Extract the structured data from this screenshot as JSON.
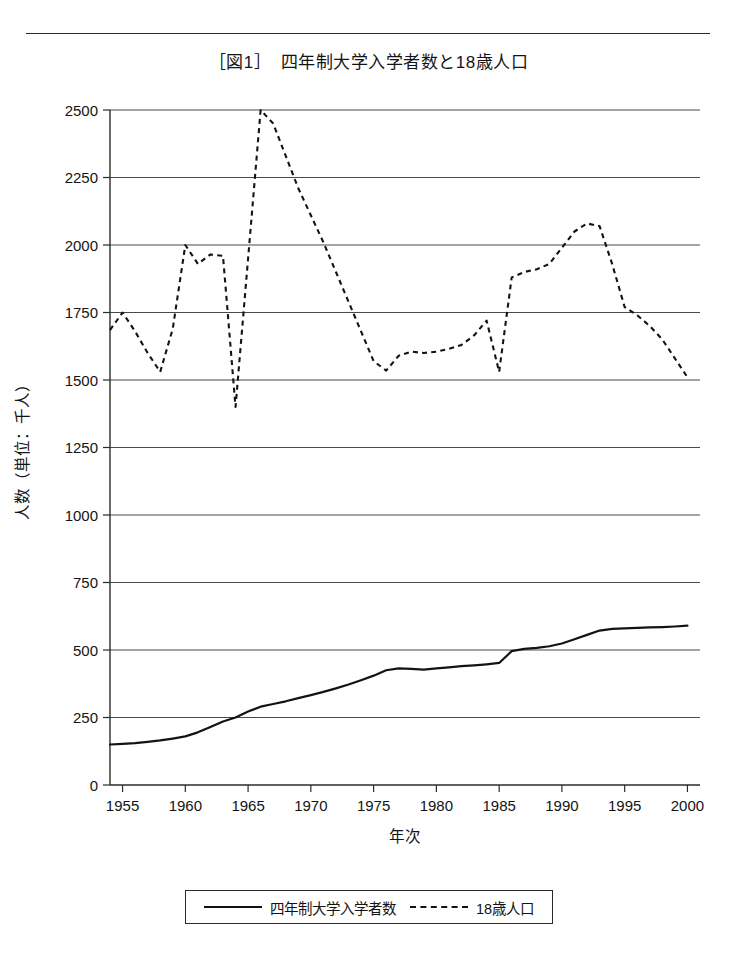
{
  "figure": {
    "top_rule": true,
    "title": "［図1］　四年制大学入学者数と18歳人口"
  },
  "legend": {
    "entries": [
      {
        "marker": "solid-line-swatch",
        "label": "四年制大学入学者数"
      },
      {
        "marker": "dashed-line-swatch",
        "label": "18歳人口"
      }
    ]
  },
  "chart_data": {
    "type": "line",
    "title": "［図1］　四年制大学入学者数と18歳人口",
    "xlabel": "年次",
    "ylabel": "人数（単位：千人）",
    "xlim": [
      1954,
      2001
    ],
    "ylim": [
      0,
      2500
    ],
    "grid": true,
    "legend_position": "bottom",
    "xticks": [
      1955,
      1960,
      1965,
      1970,
      1975,
      1980,
      1985,
      1990,
      1995,
      2000
    ],
    "xtick_labels": [
      "1955",
      "1960",
      "1965",
      "1970",
      "1975",
      "1980",
      "1985",
      "1990",
      "1995",
      "2000"
    ],
    "yticks": [
      0,
      250,
      500,
      750,
      1000,
      1250,
      1500,
      1750,
      2000,
      2250,
      2500
    ],
    "ytick_labels": [
      "0",
      "250",
      "500",
      "750",
      "1000",
      "1250",
      "1500",
      "1750",
      "2000",
      "2250",
      "2500"
    ],
    "x": [
      1954,
      1955,
      1956,
      1957,
      1958,
      1959,
      1960,
      1961,
      1962,
      1963,
      1964,
      1965,
      1966,
      1967,
      1968,
      1969,
      1970,
      1971,
      1972,
      1973,
      1974,
      1975,
      1976,
      1977,
      1978,
      1979,
      1980,
      1981,
      1982,
      1983,
      1984,
      1985,
      1986,
      1987,
      1988,
      1989,
      1990,
      1991,
      1992,
      1993,
      1994,
      1995,
      1996,
      1997,
      1998,
      1999,
      2000
    ],
    "series": [
      {
        "name": "四年制大学入学者数",
        "style": "solid",
        "values": [
          150,
          152,
          155,
          160,
          165,
          172,
          180,
          195,
          215,
          235,
          250,
          272,
          290,
          300,
          310,
          322,
          333,
          345,
          358,
          372,
          388,
          405,
          425,
          432,
          430,
          427,
          432,
          436,
          440,
          443,
          447,
          452,
          496,
          504,
          508,
          514,
          524,
          540,
          556,
          572,
          578,
          580,
          582,
          584,
          585,
          587,
          590
        ]
      },
      {
        "name": "18歳人口",
        "style": "dashed",
        "values": [
          1685,
          1750,
          1680,
          1600,
          1530,
          1690,
          2000,
          1930,
          1965,
          1960,
          1400,
          1950,
          2500,
          2450,
          2330,
          2210,
          2110,
          2010,
          1900,
          1790,
          1680,
          1570,
          1535,
          1590,
          1605,
          1600,
          1605,
          1615,
          1630,
          1665,
          1720,
          1530,
          1880,
          1900,
          1910,
          1930,
          1990,
          2050,
          2080,
          2070,
          1930,
          1770,
          1740,
          1700,
          1650,
          1580,
          1510
        ]
      }
    ]
  }
}
